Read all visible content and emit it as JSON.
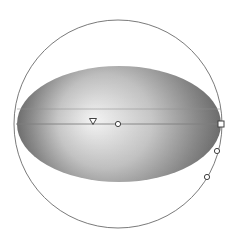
{
  "canvas": {
    "background": "#ffffff",
    "width": 235,
    "height": 243
  },
  "shape": {
    "type": "ellipse",
    "cx": 119,
    "cy": 124,
    "rx": 102,
    "ry": 58,
    "gradient": {
      "type": "radial",
      "focus": {
        "x": 93,
        "y": 119
      },
      "stops": [
        {
          "offset": 0,
          "color": "#f4f4f4"
        },
        {
          "offset": 0.45,
          "color": "#c8c8c8"
        },
        {
          "offset": 0.8,
          "color": "#8a8a8a"
        },
        {
          "offset": 1,
          "color": "#6a6a6a"
        }
      ]
    }
  },
  "gradient_circle": {
    "cx": 118,
    "cy": 124,
    "r": 104,
    "stroke": "#7a7a7a"
  },
  "guide_lines": [
    {
      "y": 109,
      "x1": 17,
      "x2": 221,
      "stroke": "#8f8f8f"
    },
    {
      "y": 124,
      "x1": 16,
      "x2": 221,
      "stroke": "#808080"
    }
  ],
  "handles": [
    {
      "name": "focus-handle",
      "shape": "triangle",
      "x": 93,
      "y": 121
    },
    {
      "name": "center-handle",
      "shape": "circle",
      "x": 118,
      "y": 124
    },
    {
      "name": "radius-handle",
      "shape": "square",
      "x": 221,
      "y": 124
    },
    {
      "name": "stop-handle-1",
      "shape": "circle",
      "x": 217,
      "y": 151
    },
    {
      "name": "stop-handle-2",
      "shape": "circle",
      "x": 207,
      "y": 177
    }
  ]
}
